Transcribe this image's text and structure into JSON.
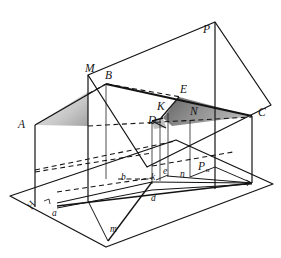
{
  "figure": {
    "domain_note": "line-drawing diagram",
    "background_color": "#ffffff",
    "stroke_color": "#131313",
    "shade_dark_color": "#7a7a7a",
    "shade_light_color": "#c9c9c9",
    "caption_faint": " "
  },
  "labels": {
    "upper": [
      {
        "id": "A",
        "text": "A",
        "x": 18,
        "y": 124
      },
      {
        "id": "B",
        "text": "B",
        "x": 106,
        "y": 77
      },
      {
        "id": "C",
        "text": "C",
        "x": 258,
        "y": 112
      },
      {
        "id": "D",
        "text": "D",
        "x": 152,
        "y": 121
      },
      {
        "id": "E",
        "text": "E",
        "x": 181,
        "y": 91
      },
      {
        "id": "K",
        "text": "K",
        "x": 159,
        "y": 108
      },
      {
        "id": "M",
        "text": "M",
        "x": 88,
        "y": 70
      },
      {
        "id": "N",
        "text": "N",
        "x": 190,
        "y": 113
      },
      {
        "id": "P",
        "text": "P",
        "x": 203,
        "y": 31
      }
    ],
    "lower": [
      {
        "id": "a",
        "text": "a",
        "x": 52,
        "y": 213
      },
      {
        "id": "b",
        "text": "b",
        "x": 122,
        "y": 177
      },
      {
        "id": "d",
        "text": "d",
        "x": 153,
        "y": 199
      },
      {
        "id": "e",
        "text": "e",
        "x": 163,
        "y": 172
      },
      {
        "id": "k",
        "text": "k",
        "x": 152,
        "y": 178
      },
      {
        "id": "m",
        "text": "m",
        "x": 110,
        "y": 229
      },
      {
        "id": "n",
        "text": "n",
        "x": 180,
        "y": 175
      }
    ],
    "trace": {
      "id": "Pн",
      "base": "P",
      "sub": "н",
      "x": 201,
      "y": 170
    },
    "plane_h": {
      "id": "H",
      "text": "H",
      "x": 34,
      "y": 207
    }
  },
  "geometry": {
    "base_plane_H": [
      [
        10,
        196
      ],
      [
        105,
        246
      ],
      [
        273,
        183
      ],
      [
        176,
        140
      ]
    ],
    "plane_P": [
      [
        88,
        75
      ],
      [
        215,
        22
      ],
      [
        271,
        104
      ],
      [
        147,
        166
      ]
    ],
    "vertical_edge_M": [
      [
        88,
        75
      ],
      [
        88,
        200
      ]
    ],
    "vertical_edge_P": [
      [
        215,
        22
      ],
      [
        215,
        188
      ]
    ],
    "vertical_edge_C": [
      [
        252,
        116
      ],
      [
        252,
        182
      ]
    ],
    "vertical_edge_A": [
      [
        35,
        125
      ],
      [
        35,
        206
      ]
    ],
    "solid_polyline_ABCM": [
      [
        35,
        125
      ],
      [
        106,
        84
      ],
      [
        252,
        116
      ]
    ],
    "triangle_shade_dark": [
      [
        163,
        117
      ],
      [
        178,
        98
      ],
      [
        252,
        116
      ]
    ],
    "triangle_shade_light": [
      [
        35,
        125
      ],
      [
        88,
        93
      ],
      [
        88,
        125
      ]
    ],
    "verticals_drops": [
      [
        [
          106,
          84
        ],
        [
          106,
          178
        ]
      ],
      [
        [
          163,
          117
        ],
        [
          163,
          180
        ]
      ],
      [
        [
          168,
          113
        ],
        [
          168,
          174
        ]
      ],
      [
        [
          190,
          119
        ],
        [
          190,
          176
        ]
      ],
      [
        [
          152,
          120
        ],
        [
          152,
          181
        ]
      ]
    ],
    "dashed_lines": [
      [
        [
          88,
          93
        ],
        [
          106,
          84
        ]
      ],
      [
        [
          88,
          125
        ],
        [
          252,
          116
        ]
      ],
      [
        [
          35,
          170
        ],
        [
          176,
          140
        ]
      ],
      [
        [
          106,
          84
        ],
        [
          178,
          98
        ]
      ],
      [
        [
          60,
          196
        ],
        [
          152,
          181
        ]
      ],
      [
        [
          152,
          165
        ],
        [
          215,
          155
        ]
      ],
      [
        [
          120,
          178
        ],
        [
          152,
          178
        ]
      ]
    ],
    "base_figure_lines": [
      [
        [
          58,
          206
        ],
        [
          152,
          181
        ]
      ],
      [
        [
          58,
          206
        ],
        [
          252,
          182
        ]
      ],
      [
        [
          152,
          181
        ],
        [
          252,
          182
        ]
      ],
      [
        [
          152,
          181
        ],
        [
          108,
          240
        ]
      ],
      [
        [
          88,
          200
        ],
        [
          152,
          190
        ]
      ],
      [
        [
          152,
          190
        ],
        [
          252,
          182
        ]
      ]
    ]
  }
}
